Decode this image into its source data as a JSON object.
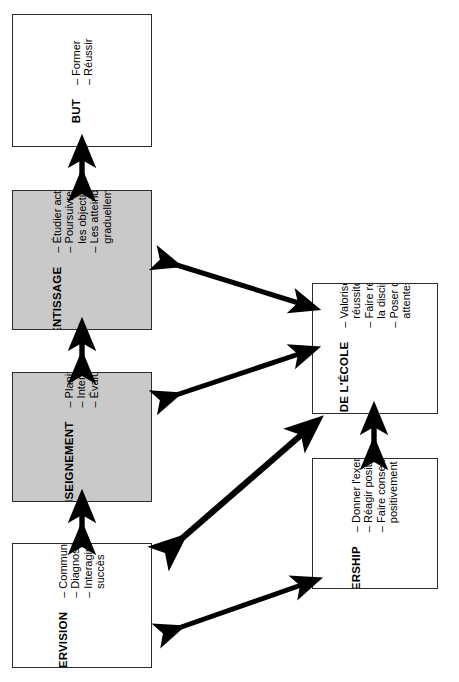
{
  "diagram": {
    "orientation": "rotated-90-ccw",
    "header_fragment": "",
    "colors": {
      "shaded_fill": "#c9c9c9",
      "plain_fill": "#ffffff",
      "stroke": "#2b2b2b",
      "arrow": "#000000"
    },
    "boxes": [
      {
        "id": "but",
        "title": "BUT",
        "shaded": false,
        "items": [
          "Former",
          "Réussir"
        ]
      },
      {
        "id": "apprentissage",
        "title": "APPRENTISSAGE",
        "shaded": true,
        "items": [
          "Étudier activement",
          "Poursuivre tous les objectifs",
          "Les atteindre graduellement"
        ]
      },
      {
        "id": "enseignement",
        "title": "ENSEIGNEMENT",
        "shaded": true,
        "items": [
          "Planifier",
          "Interagir",
          "Évaluer"
        ]
      },
      {
        "id": "supervision",
        "title": "SUPERVISION",
        "shaded": false,
        "items": [
          "Communiquer",
          "Diagnostiquer",
          "Interagir avec succès"
        ]
      },
      {
        "id": "climat",
        "title": "CLIMAT DE L'ÉCOLE",
        "shaded": false,
        "items": [
          "Valoriser la réussite scolaire",
          "Faire régner la discipline",
          "Poser des attentes élevées"
        ]
      },
      {
        "id": "leadership",
        "title": "LEADERSHIP",
        "shaded": false,
        "items": [
          "Donner l'exemple",
          "Réagir positivement",
          "Faire consensus positivement"
        ]
      }
    ],
    "connectors": [
      {
        "id": "but-apprentissage",
        "from": "apprentissage",
        "to": "but",
        "style": "double-headed-vertical"
      },
      {
        "id": "apprentissage-enseignement",
        "from": "enseignement",
        "to": "apprentissage",
        "style": "double-headed-vertical"
      },
      {
        "id": "enseignement-supervision",
        "from": "supervision",
        "to": "enseignement",
        "style": "double-headed-vertical"
      },
      {
        "id": "climat-leadership",
        "from": "leadership",
        "to": "climat",
        "style": "double-headed-vertical"
      },
      {
        "id": "apprentissage-climat",
        "from": "climat",
        "to": "apprentissage",
        "style": "double-headed-diagonal"
      },
      {
        "id": "enseignement-climat",
        "from": "climat",
        "to": "enseignement",
        "style": "double-headed-diagonal"
      },
      {
        "id": "enseignement-leadership",
        "from": "leadership",
        "to": "enseignement",
        "style": "double-headed-diagonal"
      },
      {
        "id": "supervision-leadership",
        "from": "leadership",
        "to": "supervision",
        "style": "double-headed-diagonal"
      }
    ]
  }
}
